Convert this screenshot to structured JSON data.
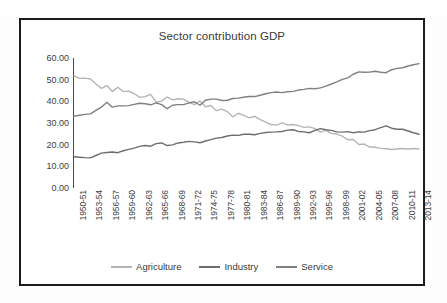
{
  "chart_data": {
    "type": "line",
    "title": "Sector contribution GDP",
    "xlabel": "",
    "ylabel": "",
    "ylim": [
      0,
      60
    ],
    "yticks": [
      "0.00",
      "10.00",
      "20.00",
      "30.00",
      "40.00",
      "50.00",
      "60.00"
    ],
    "ytick_values": [
      0,
      10,
      20,
      30,
      40,
      50,
      60
    ],
    "grid": false,
    "legend_position": "bottom",
    "x_tick_step": 3,
    "x": [
      "1950-51",
      "1951-52",
      "1952-53",
      "1953-54",
      "1954-55",
      "1955-56",
      "1956-57",
      "1957-58",
      "1958-59",
      "1959-60",
      "1960-61",
      "1961-62",
      "1962-63",
      "1963-64",
      "1964-65",
      "1965-66",
      "1966-67",
      "1967-68",
      "1968-69",
      "1969-70",
      "1970-71",
      "1971-72",
      "1972-73",
      "1973-74",
      "1974-75",
      "1975-76",
      "1976-77",
      "1977-78",
      "1978-79",
      "1979-80",
      "1980-81",
      "1981-82",
      "1982-83",
      "1983-84",
      "1984-85",
      "1985-86",
      "1986-87",
      "1987-88",
      "1988-89",
      "1989-90",
      "1990-91",
      "1991-92",
      "1992-93",
      "1993-94",
      "1994-95",
      "1995-96",
      "1996-97",
      "1997-98",
      "1998-99",
      "1999-00",
      "2000-01",
      "2001-02",
      "2002-03",
      "2003-04",
      "2004-05",
      "2005-06",
      "2006-07",
      "2007-08",
      "2008-09",
      "2009-10",
      "2010-11",
      "2011-12",
      "2012-13",
      "2013-14"
    ],
    "xtick_labels": [
      "1950-51",
      "1953-54",
      "1956-57",
      "1959-60",
      "1962-63",
      "1965-66",
      "1968-69",
      "1971-72",
      "1974-75",
      "1977-78",
      "1980-81",
      "1983-84",
      "1986-87",
      "1989-90",
      "1992-93",
      "1995-96",
      "1998-99",
      "2001-02",
      "2004-05",
      "2007-08",
      "2010-11",
      "2013-14"
    ],
    "series": [
      {
        "name": "Agriculture",
        "color": "#b5b5b5",
        "values": [
          51.8,
          50.6,
          50.7,
          50.3,
          48.0,
          46.0,
          47.3,
          44.5,
          46.5,
          44.5,
          44.7,
          43.5,
          41.8,
          42.2,
          43.2,
          39.6,
          40.1,
          42.0,
          40.7,
          41.2,
          41.0,
          39.5,
          38.5,
          40.2,
          37.5,
          38.1,
          35.7,
          36.4,
          35.2,
          32.9,
          34.5,
          33.5,
          32.4,
          33.1,
          31.6,
          30.4,
          29.3,
          29.0,
          30.1,
          29.1,
          29.3,
          28.8,
          28.0,
          28.2,
          27.4,
          25.8,
          26.6,
          25.2,
          24.9,
          23.9,
          22.3,
          22.4,
          20.1,
          20.3,
          18.9,
          18.8,
          18.3,
          18.1,
          17.8,
          18.0,
          18.2,
          18.0,
          18.2,
          18.0
        ]
      },
      {
        "name": "Industry",
        "color": "#6e6e6e",
        "values": [
          14.4,
          14.2,
          14.0,
          13.9,
          15.0,
          16.1,
          16.4,
          16.6,
          16.3,
          17.2,
          17.8,
          18.4,
          19.2,
          19.6,
          19.3,
          20.5,
          20.8,
          19.6,
          19.9,
          20.8,
          21.1,
          21.5,
          21.3,
          20.9,
          21.7,
          22.3,
          23.0,
          23.3,
          24.0,
          24.4,
          24.3,
          24.8,
          24.8,
          24.6,
          25.2,
          25.6,
          25.8,
          25.9,
          26.1,
          26.7,
          26.9,
          26.1,
          25.9,
          25.5,
          26.6,
          27.4,
          26.9,
          26.6,
          25.9,
          25.8,
          26.0,
          25.5,
          25.9,
          25.8,
          26.5,
          26.9,
          27.9,
          28.7,
          27.6,
          27.1,
          27.1,
          26.3,
          25.5,
          24.8
        ]
      },
      {
        "name": "Service",
        "color": "#808080",
        "values": [
          33.1,
          33.6,
          34.0,
          34.2,
          35.8,
          37.3,
          39.6,
          37.3,
          37.9,
          37.9,
          38.0,
          38.6,
          39.1,
          38.9,
          38.4,
          39.3,
          38.5,
          36.6,
          38.2,
          38.5,
          38.5,
          39.3,
          39.8,
          38.2,
          40.5,
          41.0,
          41.0,
          40.4,
          40.5,
          41.3,
          41.5,
          41.9,
          42.2,
          42.2,
          42.8,
          43.5,
          44.0,
          44.3,
          44.0,
          44.4,
          44.6,
          45.2,
          45.5,
          46.0,
          45.8,
          46.2,
          47.0,
          48.0,
          49.0,
          50.1,
          50.8,
          52.5,
          53.6,
          53.4,
          53.5,
          53.9,
          53.4,
          53.2,
          54.6,
          55.2,
          55.5,
          56.3,
          56.9,
          57.4
        ]
      }
    ]
  },
  "legend": {
    "items": [
      {
        "label": "Agriculture",
        "color": "#b5b5b5"
      },
      {
        "label": "Industry",
        "color": "#6e6e6e"
      },
      {
        "label": "Service",
        "color": "#808080"
      }
    ]
  }
}
